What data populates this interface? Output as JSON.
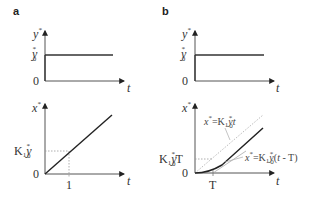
{
  "panels": [
    {
      "label": "a",
      "top_plot": {
        "y_axis_label": "y",
        "y_axis_sup": "*",
        "x_axis_label": "t",
        "level_label": "y",
        "level_sup": "*",
        "level_sub": "0",
        "origin_label": "0"
      },
      "bottom_plot": {
        "y_axis_label": "x",
        "y_axis_sup": "*",
        "x_axis_label": "t",
        "origin_label": "0",
        "y_marker_K": "K",
        "y_marker_K_sub": "1",
        "y_marker_y": "y",
        "y_marker_y_sup": "*",
        "y_marker_y_sub": "0",
        "x_tick_label": "1"
      }
    },
    {
      "label": "b",
      "top_plot": {
        "y_axis_label": "y",
        "y_axis_sup": "*",
        "x_axis_label": "t",
        "level_label": "y",
        "level_sup": "*",
        "level_sub": "0",
        "origin_label": "0"
      },
      "bottom_plot": {
        "y_axis_label": "x",
        "y_axis_sup": "*",
        "x_axis_label": "t",
        "origin_label": "0",
        "y_marker_K": "K",
        "y_marker_K_sub": "1",
        "y_marker_y": "y",
        "y_marker_y_sup": "*",
        "y_marker_y_sub": "0",
        "y_marker_T": "T",
        "x_tick_label": "T",
        "annotation_upper": {
          "x": "x",
          "sup": "*",
          "eq": "=K",
          "K_sub": "1",
          "y": "y",
          "y_sup": "*",
          "y_sub": "0",
          "t": "t"
        },
        "annotation_lower": {
          "x": "x",
          "sup": "*",
          "eq": "=K",
          "K_sub": "1",
          "y": "y",
          "y_sup": "*",
          "y_sub": "0",
          "open": "(",
          "t": "t",
          "rest": " - T)"
        }
      }
    }
  ],
  "colors": {
    "axis": "#555555",
    "curve": "#222222",
    "guide": "#aaaaaa"
  }
}
